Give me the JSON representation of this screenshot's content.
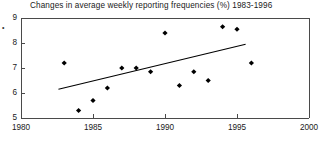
{
  "chart_data": {
    "type": "scatter",
    "title": "Changes in average weekly reporting frequencies (%) 1983-1996",
    "xlabel": "",
    "ylabel": "",
    "xlim": [
      1980,
      2000
    ],
    "ylim": [
      5,
      9
    ],
    "xticks": [
      1980,
      1985,
      1990,
      1995,
      2000
    ],
    "yticks": [
      5,
      6,
      7,
      8,
      9
    ],
    "grid": false,
    "legend": null,
    "series": [
      {
        "name": "Average weekly reporting frequency (%)",
        "marker": "diamond",
        "color": "#000000",
        "x": [
          1983,
          1984,
          1985,
          1986,
          1987,
          1988,
          1989,
          1990,
          1991,
          1992,
          1993,
          1994,
          1995,
          1996
        ],
        "y": [
          7.2,
          5.3,
          5.7,
          6.2,
          7.0,
          7.0,
          6.85,
          8.4,
          6.3,
          6.85,
          6.5,
          8.65,
          8.55,
          7.2
        ]
      }
    ],
    "trendline": {
      "name": "linear trend",
      "color": "#000000",
      "x": [
        1982.6,
        1995.6
      ],
      "y": [
        6.15,
        7.95
      ]
    }
  },
  "artifact": {
    "stray_mark": "•"
  }
}
